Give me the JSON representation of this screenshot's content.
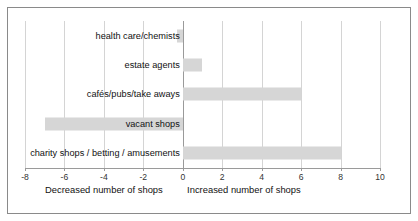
{
  "chart_data": {
    "type": "bar",
    "orientation": "horizontal",
    "title": "",
    "subtitle": "",
    "xlabel": "",
    "ylabel": "",
    "xlim": [
      -8,
      10
    ],
    "grid": true,
    "legend": false,
    "categories": [
      "health care/chemists",
      "estate agents",
      "cafés/pubs/take aways",
      "vacant shops",
      "charity shops / betting / amusements"
    ],
    "values": [
      -0.3,
      1,
      6,
      -7,
      8
    ],
    "xticks": [
      -8,
      -6,
      -4,
      -2,
      0,
      2,
      4,
      6,
      8,
      10
    ],
    "xtick_labels": [
      "-8",
      "-6",
      "-4",
      "-2",
      "0",
      "2",
      "4",
      "6",
      "8",
      "10"
    ],
    "annotations": [
      {
        "text": "Decreased number of shops",
        "x": -4
      },
      {
        "text": "Increased number of shops",
        "x": 3.1
      }
    ],
    "colors": {
      "bar": "#d6d6d6",
      "gridline": "#d4d4d4",
      "axis": "#9a9a9a",
      "frame": "#8a8a8a",
      "background": "#ffffff",
      "text": "#111111"
    }
  }
}
